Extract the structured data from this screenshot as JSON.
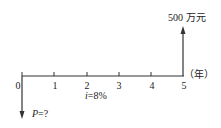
{
  "diagram": {
    "type": "cash-flow-diagram",
    "axis": {
      "ticks": [
        "0",
        "1",
        "2",
        "3",
        "4",
        "5"
      ],
      "unit_label": "（年）"
    },
    "cash_flows": {
      "inflow": {
        "period": "5",
        "label": "500 万元"
      },
      "outflow": {
        "period": "0",
        "label_var": "P",
        "label_rest": "=?"
      }
    },
    "rate": {
      "var": "i",
      "rest": "=8%"
    }
  }
}
